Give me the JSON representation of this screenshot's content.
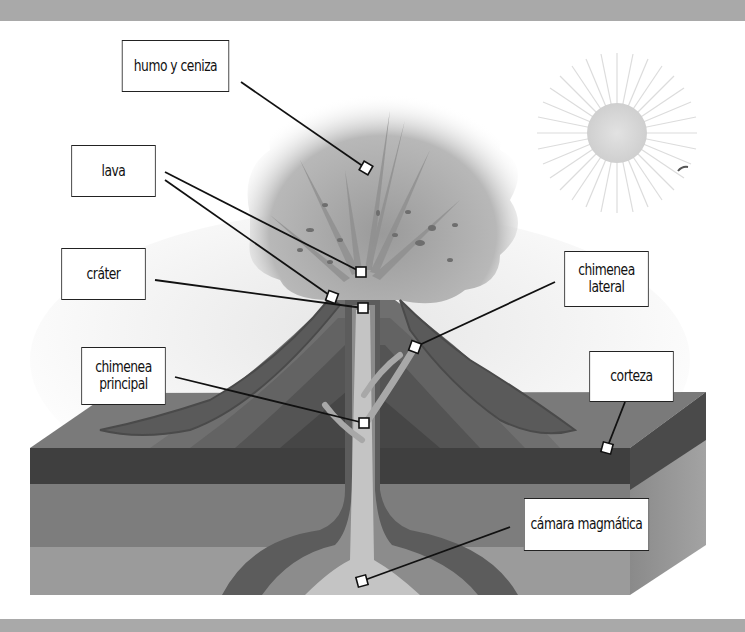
{
  "diagram": {
    "labels": {
      "humo": {
        "text": "humo y ceniza",
        "box": [
          110,
          40,
          131,
          52
        ],
        "marker": [
          367,
          169
        ]
      },
      "lava": {
        "text": "lava",
        "box": [
          62,
          145,
          103,
          52
        ],
        "markers": [
          [
            361,
            272
          ],
          [
            332,
            297
          ]
        ]
      },
      "crater": {
        "text": "cráter",
        "box": [
          52,
          248,
          103,
          52
        ],
        "marker": [
          363,
          308
        ]
      },
      "chimenea_principal": {
        "line1": "chimenea",
        "line2": "principal",
        "box": [
          72,
          347,
          103,
          58
        ],
        "marker": [
          364,
          423
        ]
      },
      "chimenea_lateral": {
        "line1": "chimenea",
        "line2": "lateral",
        "box": [
          555,
          251,
          103,
          56
        ],
        "marker": [
          415,
          347
        ]
      },
      "corteza": {
        "text": "corteza",
        "box": [
          580,
          351,
          103,
          51
        ],
        "marker": [
          607,
          448
        ]
      },
      "camara": {
        "text": "cámara magmática",
        "box": [
          510,
          498,
          153,
          53
        ],
        "marker": [
          362,
          581
        ]
      }
    },
    "colors": {
      "frame_bar": "#a9a9a9",
      "crust_top": "#7a7a7a",
      "crust_dark_layer": "#3f3f3f",
      "crust_mid_layer": "#7d7d7d",
      "crust_low_layer": "#9b9b9b",
      "magma_light": "#d2d2d2",
      "smoke": "#a8a8a8",
      "sun": "#d9d9d9"
    }
  }
}
